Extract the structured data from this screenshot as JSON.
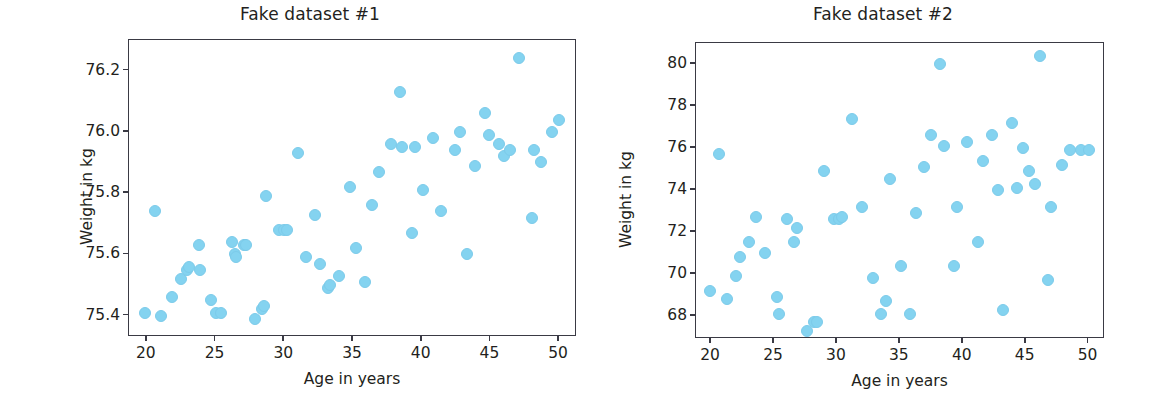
{
  "figure": {
    "background": "#ffffff",
    "marker_color": "#84d3f0",
    "axis_color": "#3a3a44",
    "text_color": "#231f20"
  },
  "panels": [
    {
      "title": "Fake dataset #1",
      "xlabel": "Age in years",
      "ylabel": "Weight in kg",
      "xticks": [
        "20",
        "25",
        "30",
        "35",
        "40",
        "45",
        "50"
      ],
      "yticks": [
        "75.4",
        "75.6",
        "75.8",
        "76.0",
        "76.2"
      ]
    },
    {
      "title": "Fake dataset #2",
      "xlabel": "Age in years",
      "ylabel": "Weight in kg",
      "xticks": [
        "20",
        "25",
        "30",
        "35",
        "40",
        "45",
        "50"
      ],
      "yticks": [
        "68",
        "70",
        "72",
        "74",
        "76",
        "78",
        "80"
      ]
    }
  ],
  "chart_data": [
    {
      "type": "scatter",
      "title": "Fake dataset #1",
      "xlabel": "Age in years",
      "ylabel": "Weight in kg",
      "xlim": [
        18.7,
        51.3
      ],
      "ylim": [
        75.33,
        76.3
      ],
      "xticks": [
        20,
        25,
        30,
        35,
        40,
        45,
        50
      ],
      "yticks": [
        75.4,
        75.6,
        75.8,
        76.0,
        76.2
      ],
      "grid": false,
      "legend": null,
      "marker_color": "#84d3f0",
      "x": [
        19.9,
        20.6,
        21.0,
        21.8,
        22.5,
        22.9,
        23.1,
        23.8,
        23.9,
        24.7,
        25.0,
        25.4,
        26.2,
        26.4,
        26.5,
        27.1,
        27.2,
        27.9,
        28.4,
        28.5,
        28.7,
        29.6,
        30.0,
        30.2,
        31.0,
        31.6,
        32.2,
        32.6,
        33.2,
        33.3,
        34.0,
        34.8,
        35.2,
        35.9,
        36.4,
        36.9,
        37.8,
        38.4,
        38.6,
        39.3,
        39.5,
        40.1,
        40.8,
        41.4,
        42.4,
        42.8,
        43.3,
        43.9,
        44.6,
        44.9,
        45.6,
        46.0,
        46.4,
        47.1,
        48.0,
        48.2,
        48.7,
        49.5,
        50.0
      ],
      "y": [
        75.41,
        75.74,
        75.4,
        75.46,
        75.52,
        75.55,
        75.56,
        75.63,
        75.55,
        75.45,
        75.41,
        75.41,
        75.64,
        75.6,
        75.59,
        75.63,
        75.63,
        75.39,
        75.42,
        75.43,
        75.79,
        75.68,
        75.68,
        75.68,
        75.93,
        75.59,
        75.73,
        75.57,
        75.49,
        75.5,
        75.53,
        75.82,
        75.62,
        75.51,
        75.76,
        75.87,
        75.96,
        76.13,
        75.95,
        75.67,
        75.95,
        75.81,
        75.98,
        75.74,
        75.94,
        76.0,
        75.6,
        75.89,
        76.06,
        75.99,
        75.96,
        75.92,
        75.94,
        76.24,
        75.72,
        75.94,
        75.9,
        76.0,
        76.04
      ]
    },
    {
      "type": "scatter",
      "title": "Fake dataset #2",
      "xlabel": "Age in years",
      "ylabel": "Weight in kg",
      "xlim": [
        18.8,
        51.3
      ],
      "ylim": [
        66.9,
        81.0
      ],
      "xticks": [
        20,
        25,
        30,
        35,
        40,
        45,
        50
      ],
      "yticks": [
        68,
        70,
        72,
        74,
        76,
        78,
        80
      ],
      "grid": false,
      "legend": null,
      "marker_color": "#84d3f0",
      "x": [
        19.9,
        20.6,
        21.3,
        22.0,
        22.3,
        23.0,
        23.6,
        24.3,
        25.2,
        25.4,
        26.0,
        26.6,
        26.8,
        27.6,
        28.2,
        28.4,
        29.0,
        29.8,
        30.2,
        30.4,
        31.2,
        32.0,
        32.9,
        33.5,
        33.9,
        34.2,
        35.1,
        35.8,
        36.3,
        36.9,
        37.5,
        38.2,
        38.5,
        39.3,
        39.5,
        40.3,
        41.2,
        41.6,
        42.3,
        42.8,
        43.2,
        43.9,
        44.3,
        44.8,
        45.3,
        45.7,
        46.1,
        46.8,
        47.0,
        47.9,
        48.5,
        49.4,
        50.0
      ],
      "y": [
        69.2,
        75.7,
        68.8,
        69.9,
        70.8,
        71.5,
        72.7,
        71.0,
        68.9,
        68.1,
        72.6,
        71.5,
        72.2,
        67.3,
        67.7,
        67.7,
        74.9,
        72.6,
        72.6,
        72.7,
        77.4,
        73.2,
        69.8,
        68.1,
        68.7,
        74.5,
        70.4,
        68.1,
        72.9,
        75.1,
        76.6,
        80.0,
        76.1,
        70.4,
        73.2,
        76.3,
        71.5,
        75.4,
        76.6,
        74.0,
        68.3,
        77.2,
        74.1,
        76.0,
        74.9,
        74.3,
        80.4,
        69.7,
        73.2,
        75.2,
        75.9,
        75.9,
        75.9
      ]
    }
  ]
}
